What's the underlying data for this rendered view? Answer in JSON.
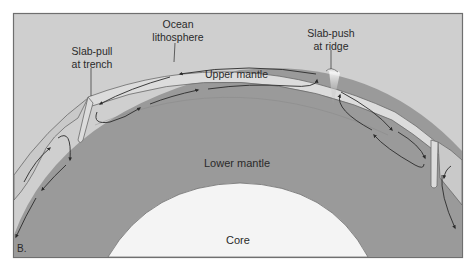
{
  "figure": {
    "panel_label": "B.",
    "labels": {
      "ocean_lithosphere_line1": "Ocean",
      "ocean_lithosphere_line2": "lithosphere",
      "slab_pull_line1": "Slab-pull",
      "slab_pull_line2": "at trench",
      "slab_push_line1": "Slab-push",
      "slab_push_line2": "at ridge",
      "upper_mantle": "Upper mantle",
      "lower_mantle": "Lower mantle",
      "core": "Core"
    },
    "colors": {
      "background": "#cfcfcf",
      "mantle": "#9a9a9a",
      "upper_mantle": "#a3a3a3",
      "lithosphere": "#dcdcdc",
      "core": "#f4f4f4",
      "frame": "#6f6f6f",
      "arrow": "#2b2b2b"
    }
  }
}
